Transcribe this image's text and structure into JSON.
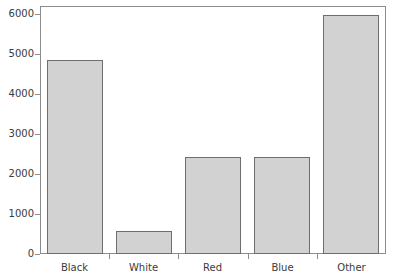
{
  "chart_data": {
    "type": "bar",
    "title": "",
    "subtitle": "",
    "xlabel": "",
    "ylabel": "",
    "categories": [
      "Black",
      "White",
      "Red",
      "Blue",
      "Other"
    ],
    "values": [
      4850,
      580,
      2430,
      2420,
      5980
    ],
    "ylim": [
      0,
      6200
    ],
    "y_ticks": [
      0,
      1000,
      2000,
      3000,
      4000,
      5000,
      6000
    ],
    "y_tick_labels": [
      "0",
      "1000",
      "2000",
      "3000",
      "4000",
      "5000",
      "6000"
    ],
    "grid": false,
    "legend": "none",
    "bar_fill_color": "#d2d2d2",
    "bar_edge_color": "#6e6e6e",
    "axis_color": "#8c8c8c",
    "text_color": "#3b3b3b",
    "background_color": "#ffffff"
  }
}
